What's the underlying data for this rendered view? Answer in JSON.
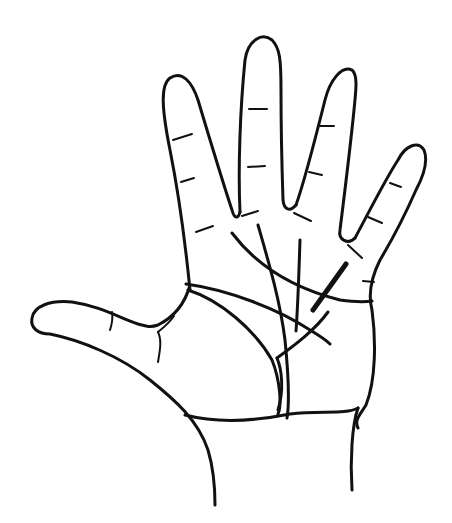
{
  "figure": {
    "type": "line-drawing",
    "background": "#ffffff",
    "stroke_color": "#111111",
    "elements": [
      "hand-outline",
      "thumb",
      "index-finger",
      "middle-finger",
      "ring-finger",
      "little-finger",
      "finger-joint-creases",
      "heart-line",
      "head-line",
      "life-line",
      "fate-line",
      "sun-line",
      "bold-marks"
    ]
  }
}
